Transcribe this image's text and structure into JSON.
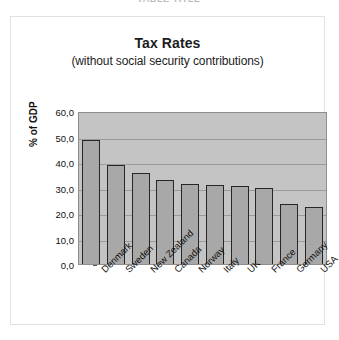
{
  "header": {
    "cut_off_text": "TABLE  TITLE"
  },
  "chart_data": {
    "type": "bar",
    "title": "Tax Rates",
    "subtitle": "(without social security contributions)",
    "xlabel": "",
    "ylabel": "% of GDP",
    "ylim": [
      0,
      60
    ],
    "ytick_values": [
      0,
      10,
      20,
      30,
      40,
      50,
      60
    ],
    "ytick_labels": [
      "0,0",
      "10,0",
      "20,0",
      "30,0",
      "40,0",
      "50,0",
      "60,0"
    ],
    "grid": true,
    "legend": "none",
    "categories": [
      "Denmark",
      "Sweden",
      "New Zealand",
      "Canada",
      "Norway",
      "Italy",
      "UK",
      "France",
      "Germany",
      "USA"
    ],
    "values": [
      48.5,
      39.0,
      35.5,
      33.0,
      31.5,
      31.0,
      30.5,
      29.8,
      23.5,
      22.5
    ],
    "colors": {
      "bar_fill": "#a8a8a8",
      "bar_outline": "#262626",
      "plot_background": "#c4c4c4",
      "gridline": "#9a9a9a",
      "text": "#111111",
      "figure_background": "#ffffff",
      "frame": "#e2e2e4"
    }
  }
}
